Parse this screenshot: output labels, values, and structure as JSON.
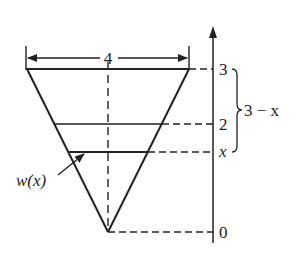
{
  "diagram": {
    "type": "inverted-triangle-tank-cross-section",
    "width_label": "4",
    "axis_ticks": [
      {
        "label": "3",
        "y": 69
      },
      {
        "label": "2",
        "y": 124
      },
      {
        "label": "x",
        "y": 152,
        "italic": true
      },
      {
        "label": "0",
        "y": 232
      }
    ],
    "brace_label": "3 − x",
    "width_function_label": "w(x)",
    "colors": {
      "line": "#222222",
      "background": "#ffffff"
    }
  }
}
